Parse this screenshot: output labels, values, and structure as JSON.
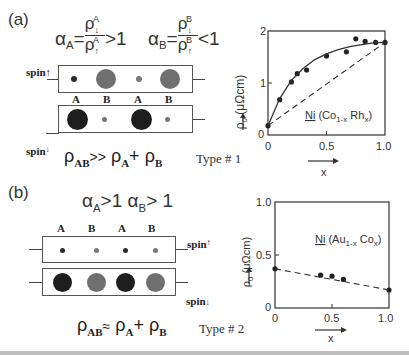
{
  "panel_a": {
    "label": "(a)",
    "alpha_A": {
      "lhs": "α",
      "sub": "A",
      "eq": "=",
      "num": "ρ",
      "num_sup": "A",
      "num_sub": "↓",
      "den": "ρ",
      "den_sup": "A",
      "den_sub": "↑",
      "rel": ">1"
    },
    "alpha_B": {
      "lhs": "α",
      "sub": "B",
      "eq": "=",
      "num": "ρ",
      "num_sup": "B",
      "num_sub": "↓",
      "den": "ρ",
      "den_sup": "B",
      "den_sub": "↑",
      "rel": "<1"
    },
    "spin_up_label": "spin",
    "spin_up_arrow": "↑",
    "spin_down_label": "spin",
    "spin_down_arrow": "↓",
    "site_labels": [
      "A",
      "B",
      "A",
      "B"
    ],
    "relation": {
      "lhs": "ρ",
      "lhs_sub": "AB",
      "op": ">>",
      "a": "ρ",
      "a_sub": "A",
      "plus": "+",
      "b": "ρ",
      "b_sub": "B"
    },
    "type_label": "Type # 1"
  },
  "panel_b": {
    "label": "(b)",
    "condition": {
      "a": "α",
      "a_sub": "A",
      "a_rel": ">1",
      "b": "α",
      "b_sub": "B",
      "b_rel": "> 1"
    },
    "site_labels": [
      "A",
      "B",
      "A",
      "B"
    ],
    "spin_up_label": "spin",
    "spin_up_arrow": "↑",
    "spin_down_label": "spin",
    "spin_down_arrow": "↓",
    "relation": {
      "lhs": "ρ",
      "lhs_sub": "AB",
      "op": "≈",
      "a": "ρ",
      "a_sub": "A",
      "plus": "+",
      "b": "ρ",
      "b_sub": "B"
    },
    "type_label": "Type # 2"
  },
  "colors": {
    "atom_black": "#1e1e1e",
    "atom_gray": "#6f6f6f",
    "small_dot_black": "#2a2a2a",
    "small_dot_gray": "#777777",
    "line": "#333333"
  },
  "chart_data": [
    {
      "type": "scatter",
      "title": "Ni (Co1-x Rhx)",
      "annotation": {
        "ni": "Ni",
        "paren_open": "(",
        "el1": "Co",
        "el1_sub": "1-x",
        "el2": "Rh",
        "el2_sub": "x",
        "paren_close": ")"
      },
      "xlabel": "x",
      "ylabel": "ρ0 (μΩcm)",
      "ylabel_main": "ρ",
      "ylabel_sub": "0",
      "ylabel_unit": "(μΩcm)",
      "xlim": [
        0,
        1.0
      ],
      "ylim": [
        0,
        2
      ],
      "x_ticks": [
        "0",
        "0.5",
        "1.0"
      ],
      "y_ticks": [
        "0",
        "1",
        "2"
      ],
      "grid": false,
      "series": [
        {
          "name": "measured",
          "style": "points",
          "x": [
            0.0,
            0.1,
            0.2,
            0.25,
            0.33,
            0.5,
            0.67,
            0.75,
            0.83,
            0.92,
            1.0
          ],
          "y": [
            0.18,
            0.68,
            1.02,
            1.18,
            1.25,
            1.52,
            1.6,
            1.85,
            1.8,
            1.78,
            1.78
          ]
        },
        {
          "name": "fit",
          "style": "solid-curve",
          "x": [
            0.0,
            0.1,
            0.2,
            0.3,
            0.4,
            0.5,
            0.6,
            0.7,
            0.8,
            0.9,
            1.0
          ],
          "y": [
            0.18,
            0.7,
            1.05,
            1.28,
            1.45,
            1.56,
            1.64,
            1.7,
            1.74,
            1.77,
            1.78
          ]
        },
        {
          "name": "linear",
          "style": "dashed",
          "x": [
            0.0,
            1.0
          ],
          "y": [
            0.18,
            1.78
          ]
        }
      ]
    },
    {
      "type": "scatter",
      "title": "Ni (Au1-x Cox)",
      "annotation": {
        "ni": "Ni",
        "paren_open": "(",
        "el1": "Au",
        "el1_sub": "1-x",
        "el2": "Co",
        "el2_sub": "x",
        "paren_close": ")"
      },
      "xlabel": "x",
      "ylabel": "ρ0 (μΩcm)",
      "ylabel_main": "ρ",
      "ylabel_sub": "0",
      "ylabel_unit": "(μΩcm)",
      "xlim": [
        0,
        1.0
      ],
      "ylim": [
        0,
        1.0
      ],
      "x_ticks": [
        "0",
        "0.5",
        "1.0"
      ],
      "y_ticks": [
        "0",
        "0.5",
        "1.0"
      ],
      "grid": false,
      "series": [
        {
          "name": "measured",
          "style": "points",
          "x": [
            0.0,
            0.4,
            0.5,
            0.6,
            1.0
          ],
          "y": [
            0.37,
            0.31,
            0.3,
            0.27,
            0.17
          ]
        },
        {
          "name": "linear",
          "style": "dashed",
          "x": [
            0.0,
            1.0
          ],
          "y": [
            0.37,
            0.17
          ]
        }
      ]
    }
  ]
}
